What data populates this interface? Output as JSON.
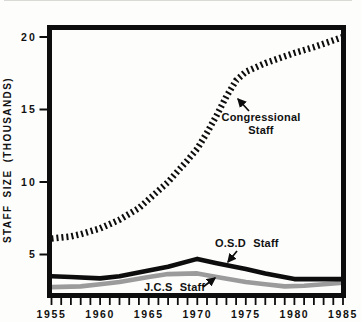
{
  "chart_data": {
    "type": "line",
    "title": "",
    "xlabel": "",
    "ylabel": "STAFF SIZE (THOUSANDS)",
    "xlim": [
      1955,
      1985
    ],
    "ylim": [
      2.3,
      20.6
    ],
    "grid": false,
    "x_ticks": [
      1955,
      1960,
      1965,
      1970,
      1975,
      1980,
      1985
    ],
    "y_ticks": [
      5,
      10,
      15,
      20
    ],
    "minor_x_ticks_every_year": true,
    "legend_position": "inline-annotations",
    "series": [
      {
        "id": "congressional",
        "name": "Congressional Staff",
        "style": "hatched-dashed",
        "color": "#0d0d0d",
        "x": [
          1955,
          1957,
          1958,
          1960,
          1962,
          1964,
          1965,
          1966,
          1967,
          1968,
          1969,
          1970,
          1971,
          1972,
          1973,
          1974,
          1975,
          1977,
          1980,
          1982,
          1985
        ],
        "values": [
          6.1,
          6.25,
          6.4,
          6.8,
          7.4,
          8.2,
          8.8,
          9.4,
          10.0,
          10.75,
          11.5,
          12.3,
          13.4,
          14.6,
          15.9,
          17.0,
          17.6,
          18.2,
          18.9,
          19.3,
          20.0
        ]
      },
      {
        "id": "osd",
        "name": "O.S.D Staff",
        "style": "solid",
        "color": "#0d0d0d",
        "x": [
          1955,
          1957,
          1960,
          1962,
          1965,
          1967,
          1970,
          1972,
          1975,
          1977,
          1980,
          1985
        ],
        "values": [
          3.5,
          3.45,
          3.35,
          3.5,
          3.9,
          4.15,
          4.7,
          4.4,
          4.0,
          3.7,
          3.3,
          3.3
        ]
      },
      {
        "id": "jcs",
        "name": "J.C.S Staff",
        "style": "solid",
        "color": "#9b9b9b",
        "x": [
          1955,
          1958,
          1960,
          1962,
          1965,
          1967,
          1970,
          1972,
          1975,
          1977,
          1979,
          1981,
          1983,
          1985
        ],
        "values": [
          2.75,
          2.8,
          2.95,
          3.1,
          3.45,
          3.65,
          3.7,
          3.45,
          3.1,
          2.95,
          2.8,
          2.85,
          2.95,
          3.05
        ]
      }
    ],
    "annotations": [
      {
        "text": "Congressional Staff",
        "points_to_series": "congressional"
      },
      {
        "text": "O.S.D Staff",
        "points_to_series": "osd"
      },
      {
        "text": "J.C.S Staff",
        "points_to_series": "jcs"
      }
    ]
  },
  "labels": {
    "y_axis_title": "STAFF SIZE (THOUSANDS)",
    "congressional_line1": "Congressional",
    "congressional_line2": "Staff",
    "osd": "O.S.D Staff",
    "jcs": "J.C.S Staff"
  },
  "colors": {
    "line_black": "#0d0d0d",
    "line_gray": "#9b9b9b",
    "background": "#fdfdfc"
  }
}
